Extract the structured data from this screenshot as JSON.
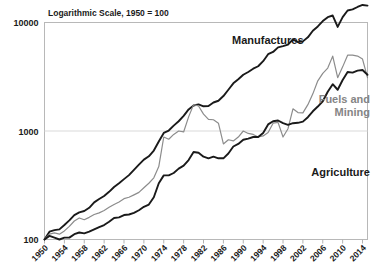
{
  "chart_data": {
    "type": "line",
    "title": "Logarithmic Scale, 1950 = 100",
    "xlabel": "",
    "ylabel": "",
    "log_y": true,
    "ylim": [
      100,
      10000
    ],
    "xlim": [
      1950,
      2015
    ],
    "grid": true,
    "legend_position": "inline-annotations",
    "y_ticks": [
      "100",
      "1000",
      "10000"
    ],
    "y_tick_values": [
      100,
      1000,
      10000
    ],
    "x_ticks": [
      "1950",
      "1954",
      "1958",
      "1962",
      "1966",
      "1970",
      "1974",
      "1978",
      "1982",
      "1986",
      "1990",
      "1994",
      "1998",
      "2002",
      "2006",
      "2010",
      "2014"
    ],
    "x_tick_values": [
      1950,
      1954,
      1958,
      1962,
      1966,
      1970,
      1974,
      1978,
      1982,
      1986,
      1990,
      1994,
      1998,
      2002,
      2006,
      2010,
      2014
    ],
    "x": [
      1950,
      1951,
      1952,
      1953,
      1954,
      1955,
      1956,
      1957,
      1958,
      1959,
      1960,
      1961,
      1962,
      1963,
      1964,
      1965,
      1966,
      1967,
      1968,
      1969,
      1970,
      1971,
      1972,
      1973,
      1974,
      1975,
      1976,
      1977,
      1978,
      1979,
      1980,
      1981,
      1982,
      1983,
      1984,
      1985,
      1986,
      1987,
      1988,
      1989,
      1990,
      1991,
      1992,
      1993,
      1994,
      1995,
      1996,
      1997,
      1998,
      1999,
      2000,
      2001,
      2002,
      2003,
      2004,
      2005,
      2006,
      2007,
      2008,
      2009,
      2010,
      2011,
      2012,
      2013,
      2014,
      2015
    ],
    "series": [
      {
        "name": "Manufactures",
        "color": "#1a1a1a",
        "label_position": {
          "x": 232,
          "y": 44
        },
        "values": [
          100,
          118,
          122,
          124,
          136,
          150,
          168,
          178,
          183,
          196,
          220,
          236,
          252,
          275,
          305,
          330,
          360,
          392,
          438,
          490,
          545,
          585,
          660,
          800,
          960,
          1010,
          1120,
          1230,
          1380,
          1580,
          1720,
          1760,
          1690,
          1700,
          1830,
          1900,
          2100,
          2400,
          2750,
          3000,
          3300,
          3500,
          3750,
          3950,
          4400,
          5100,
          5350,
          5900,
          6050,
          6250,
          7000,
          6600,
          6700,
          7300,
          8400,
          9200,
          10300,
          11200,
          11600,
          9100,
          11200,
          12900,
          13200,
          13900,
          14500,
          14300
        ]
      },
      {
        "name": "Fuels and Mining",
        "color": "#8c8c8c",
        "label_position": {
          "x": 370,
          "y": 103
        },
        "values": [
          100,
          112,
          115,
          112,
          120,
          132,
          148,
          158,
          152,
          160,
          170,
          176,
          185,
          198,
          210,
          222,
          238,
          245,
          258,
          272,
          300,
          330,
          370,
          470,
          880,
          840,
          930,
          1000,
          980,
          1350,
          1750,
          1700,
          1430,
          1280,
          1270,
          1180,
          760,
          830,
          810,
          880,
          1000,
          950,
          930,
          880,
          900,
          970,
          1180,
          1200,
          880,
          1050,
          1600,
          1480,
          1470,
          1750,
          2200,
          2900,
          3400,
          3800,
          4900,
          3100,
          3900,
          5000,
          5000,
          4900,
          4600,
          3100
        ]
      },
      {
        "name": "Agriculture",
        "color": "#1a1a1a",
        "label_position": {
          "x": 370,
          "y": 176
        },
        "values": [
          100,
          108,
          104,
          100,
          104,
          104,
          112,
          116,
          114,
          118,
          124,
          130,
          136,
          146,
          158,
          160,
          168,
          170,
          176,
          186,
          200,
          210,
          245,
          330,
          390,
          390,
          410,
          450,
          480,
          540,
          640,
          630,
          580,
          560,
          580,
          560,
          560,
          620,
          720,
          760,
          830,
          850,
          880,
          880,
          960,
          1150,
          1230,
          1250,
          1180,
          1140,
          1180,
          1190,
          1220,
          1340,
          1520,
          1680,
          1880,
          2300,
          2700,
          2400,
          2950,
          3500,
          3450,
          3600,
          3650,
          3300
        ]
      }
    ]
  },
  "annotations": {
    "manufactures_label": "Manufactures",
    "fuels_label_line1": "Fuels and",
    "fuels_label_line2": "Mining",
    "agriculture_label": "Agriculture"
  },
  "colors": {
    "manufactures": "#1a1a1a",
    "fuels_and_mining": "#8c8c8c",
    "agriculture": "#1a1a1a",
    "axis": "#b3b3b3",
    "grid": "#d9d9d9",
    "text": "#1a1a1a",
    "background": "#ffffff"
  }
}
